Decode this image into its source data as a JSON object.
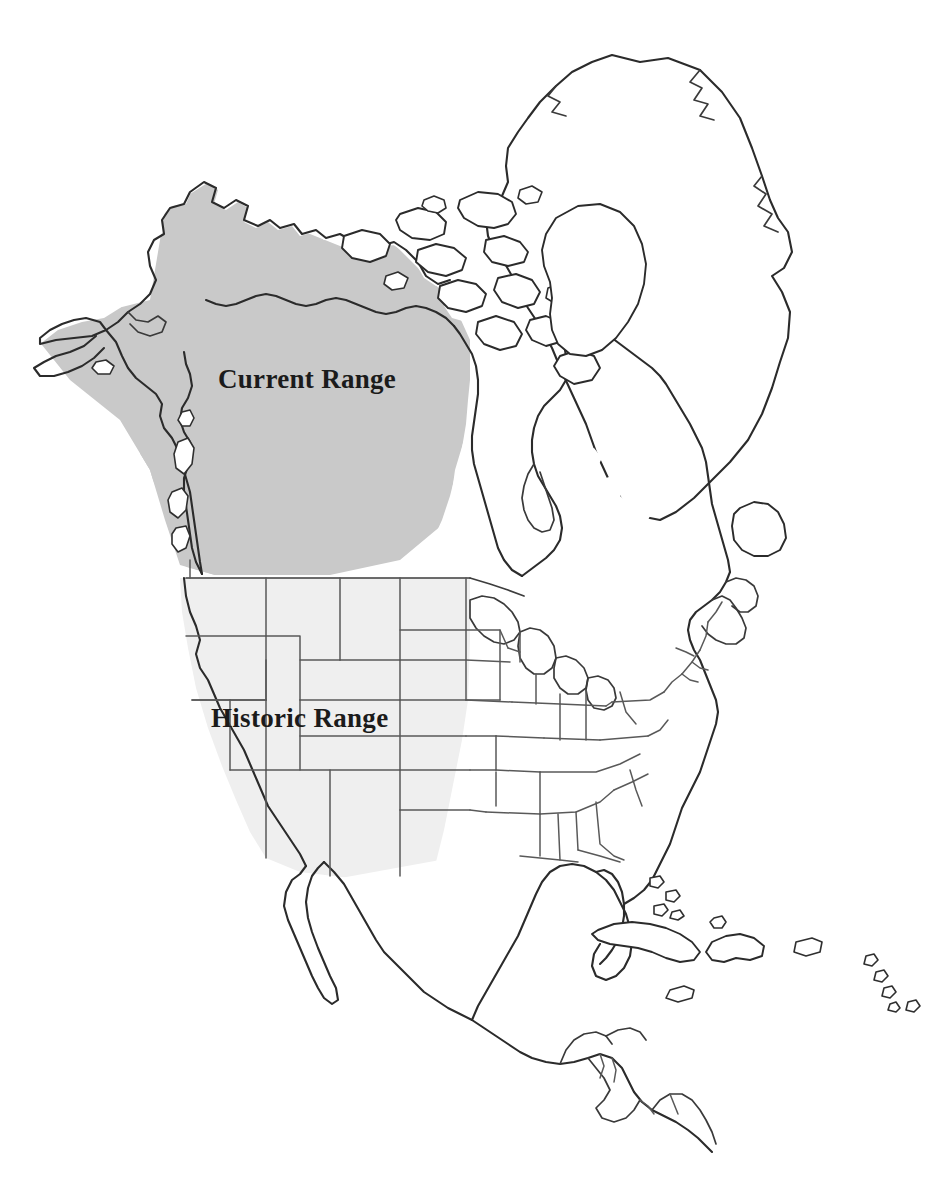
{
  "map": {
    "title": "North America Species Range Map",
    "projection_note": "",
    "background_color": "#ffffff",
    "outline_color": "#2b2b2b",
    "state_boundary_color": "#595959",
    "legend_style": "in-map labels"
  },
  "labels": [
    {
      "id": "current-range",
      "text": "Current Range",
      "x": 218,
      "y": 388,
      "font_weight": "bold",
      "font_size_px": 27,
      "color": "#1b1b1b"
    },
    {
      "id": "historic-range",
      "text": "Historic Range",
      "x": 211,
      "y": 727,
      "font_weight": "bold",
      "font_size_px": 27,
      "color": "#1b1b1b"
    }
  ],
  "ranges": [
    {
      "id": "current-range-area",
      "name": "Current Range",
      "fill_color": "#c9c9c9",
      "description": "Medium gray shaded region covering Alaska and northwestern Canada",
      "regions_covered": [
        "Alaska",
        "Yukon",
        "Northwest Territories",
        "British Columbia",
        "Alberta",
        "Saskatchewan",
        "western Manitoba",
        "western Nunavut mainland"
      ]
    },
    {
      "id": "historic-range-area",
      "name": "Historic Range",
      "fill_color": "#efefef",
      "description": "Very light gray shaded region covering the western United States",
      "regions_covered": [
        "Washington",
        "Oregon",
        "California",
        "Idaho",
        "Nevada",
        "Montana",
        "Wyoming",
        "Utah",
        "Colorado",
        "Arizona",
        "New Mexico",
        "North Dakota",
        "South Dakota",
        "Nebraska",
        "Kansas",
        "Oklahoma",
        "Texas"
      ]
    }
  ],
  "landmasses": [
    {
      "id": "greenland",
      "name": "Greenland",
      "shaded": false
    },
    {
      "id": "canada-east",
      "name": "Eastern Canada",
      "shaded": false
    },
    {
      "id": "usa-east",
      "name": "Eastern United States",
      "shaded": false
    },
    {
      "id": "mexico",
      "name": "Mexico",
      "shaded": false
    },
    {
      "id": "central-america",
      "name": "Central America",
      "shaded": false
    },
    {
      "id": "cuba",
      "name": "Cuba",
      "shaded": false
    },
    {
      "id": "hispaniola",
      "name": "Hispaniola",
      "shaded": false
    },
    {
      "id": "puerto-rico",
      "name": "Puerto Rico",
      "shaded": false
    },
    {
      "id": "bahamas",
      "name": "Bahamas",
      "shaded": false
    },
    {
      "id": "lesser-antilles",
      "name": "Lesser Antilles",
      "shaded": false
    },
    {
      "id": "arctic-archipelago",
      "name": "Canadian Arctic Archipelago",
      "shaded": false
    },
    {
      "id": "newfoundland",
      "name": "Newfoundland",
      "shaded": false
    },
    {
      "id": "vancouver-island",
      "name": "Vancouver Island",
      "shaded": true
    },
    {
      "id": "haida-gwaii",
      "name": "Haida Gwaii",
      "shaded": true
    }
  ]
}
